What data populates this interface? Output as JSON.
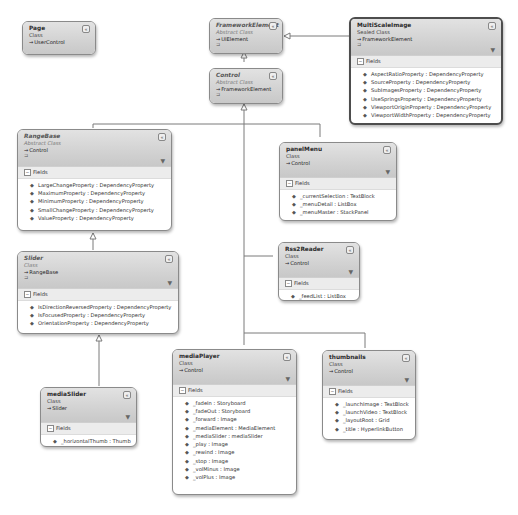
{
  "diagram": {
    "type": "class-diagram",
    "colors": {
      "header": "#d2d2d2",
      "border": "#8a8a8a",
      "lines": "#7a7a7a"
    }
  },
  "classes": {
    "page": {
      "name": "Page",
      "kind": "Class",
      "base": "UserControl"
    },
    "frameworkElement": {
      "name": "FrameworkElement",
      "kind": "Abstract Class",
      "base": "UIElement"
    },
    "control": {
      "name": "Control",
      "kind": "Abstract Class",
      "base": "FrameworkElement"
    },
    "multiScaleImage": {
      "name": "MultiScaleImage",
      "kind": "Sealed Class",
      "base": "FrameworkElement",
      "section": "Fields",
      "fields": [
        "AspectRatioProperty : DependencyProperty",
        "SourceProperty : DependencyProperty",
        "SubImagesProperty : DependencyProperty",
        "UseSpringsProperty : DependencyProperty",
        "ViewportOriginProperty : DependencyProperty",
        "ViewportWidthProperty : DependencyProperty"
      ]
    },
    "rangeBase": {
      "name": "RangeBase",
      "kind": "Abstract Class",
      "base": "Control",
      "section": "Fields",
      "fields": [
        "LargeChangeProperty : DependencyProperty",
        "MaximumProperty : DependencyProperty",
        "MinimumProperty : DependencyProperty",
        "SmallChangeProperty : DependencyProperty",
        "ValueProperty : DependencyProperty"
      ]
    },
    "panelMenu": {
      "name": "panelMenu",
      "kind": "Class",
      "base": "Control",
      "section": "Fields",
      "fields": [
        "_currentSelection : TextBlock",
        "_menuDetail : ListBox",
        "_menuMaster : StackPanel"
      ]
    },
    "slider": {
      "name": "Slider",
      "kind": "Class",
      "base": "RangeBase",
      "section": "Fields",
      "fields": [
        "IsDirectionReversedProperty : DependencyProperty",
        "IsFocusedProperty : DependencyProperty",
        "OrientationProperty : DependencyProperty"
      ]
    },
    "rss2Reader": {
      "name": "Rss2Reader",
      "kind": "Class",
      "base": "Control",
      "section": "Fields",
      "fields": [
        "_feedList : ListBox"
      ]
    },
    "mediaSlider": {
      "name": "mediaSlider",
      "kind": "Class",
      "base": "Slider",
      "section": "Fields",
      "fields": [
        "_horizontalThumb : Thumb"
      ]
    },
    "mediaPlayer": {
      "name": "mediaPlayer",
      "kind": "Class",
      "base": "Control",
      "section": "Fields",
      "fields": [
        "_fadeIn : Storyboard",
        "_fadeOut : Storyboard",
        "_forward : Image",
        "_mediaElement : MediaElement",
        "_mediaSlider : mediaSlider",
        "_play : Image",
        "_rewind : Image",
        "_stop : Image",
        "_volMinus : Image",
        "_volPlus : Image"
      ]
    },
    "thumbnails": {
      "name": "thumbnails",
      "kind": "Class",
      "base": "Control",
      "section": "Fields",
      "fields": [
        "_launchImage : TextBlock",
        "_launchVideo : TextBlock",
        "_layoutRoot : Grid",
        "_title : HyperlinkButton"
      ]
    }
  },
  "icons": {
    "collapse": "collapse-chevron-icon",
    "filter": "filter-icon",
    "inherits_arrow": "→",
    "field_public": "◆",
    "field_private": "🔒",
    "section_toggle": "−",
    "collapse_glyph": "«",
    "filter_glyph": "▼",
    "sub_glyph": "⊐"
  }
}
